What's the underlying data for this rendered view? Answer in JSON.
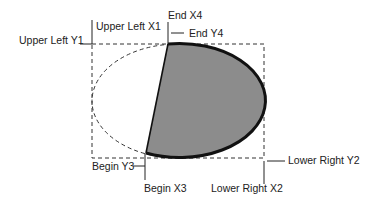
{
  "diagram": {
    "type": "pie-arc-geometry",
    "labels": {
      "upper_left_x1": "Upper Left X1",
      "upper_left_y1": "Upper Left Y1",
      "end_x4": "End X4",
      "end_y4": "End Y4",
      "begin_y3": "Begin Y3",
      "begin_x3": "Begin X3",
      "lower_right_x2": "Lower Right X2",
      "lower_right_y2": "Lower Right Y2"
    },
    "colors": {
      "fill": "#8c8c8c",
      "stroke": "#111111",
      "dashed": "#333333",
      "background": "#ffffff"
    },
    "geometry": {
      "bounding_box": {
        "x1": 92,
        "y1": 44,
        "x2": 264,
        "y2": 158
      },
      "ellipse": {
        "cx": 178,
        "cy": 101,
        "rx": 86,
        "ry": 57
      },
      "begin_point": {
        "x": 146,
        "y": 153
      },
      "end_point": {
        "x": 168,
        "y": 44
      }
    }
  }
}
